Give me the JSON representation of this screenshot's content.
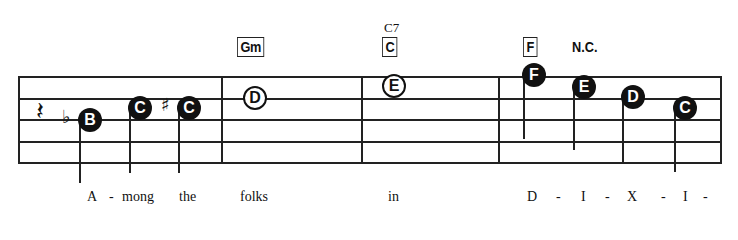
{
  "staff": {
    "lines_y": [
      76,
      98,
      119,
      141,
      162
    ],
    "left": 18,
    "right": 720,
    "barlines_x": [
      18,
      221,
      361,
      498,
      720
    ]
  },
  "rest": {
    "glyph": "𝄽",
    "name": "quarter-rest",
    "x": 36,
    "y": 96
  },
  "chords": [
    {
      "label": "Gm",
      "boxed": true,
      "x": 237,
      "y": 37
    },
    {
      "label": "C",
      "boxed": true,
      "superscript": "C7",
      "x": 382,
      "y": 37
    },
    {
      "label": "F",
      "boxed": true,
      "x": 523,
      "y": 37
    },
    {
      "label": "N.C.",
      "boxed": false,
      "x": 572,
      "y": 38
    }
  ],
  "notes": [
    {
      "letter": "B",
      "style": "filled",
      "accidental": "♭",
      "x": 78,
      "y": 108,
      "stem_top": 118,
      "stem_bottom": 183
    },
    {
      "letter": "C",
      "style": "filled",
      "x": 128,
      "y": 96,
      "stem_top": 108,
      "stem_bottom": 173
    },
    {
      "letter": "C",
      "style": "filled",
      "accidental": "♯",
      "x": 177,
      "y": 96,
      "stem_top": 108,
      "stem_bottom": 173
    },
    {
      "letter": "D",
      "style": "open",
      "x": 243,
      "y": 86
    },
    {
      "letter": "E",
      "style": "open",
      "x": 382,
      "y": 74
    },
    {
      "letter": "F",
      "style": "filled",
      "x": 522,
      "y": 63,
      "stem_top": 75,
      "stem_bottom": 139
    },
    {
      "letter": "E",
      "style": "filled",
      "x": 572,
      "y": 75,
      "stem_top": 87,
      "stem_bottom": 150
    },
    {
      "letter": "D",
      "style": "filled",
      "x": 621,
      "y": 85,
      "stem_top": 97,
      "stem_bottom": 162
    },
    {
      "letter": "C",
      "style": "filled",
      "x": 673,
      "y": 96,
      "stem_top": 108,
      "stem_bottom": 172
    }
  ],
  "lyrics": [
    {
      "text": "A",
      "x": 87
    },
    {
      "text": "-",
      "x": 109
    },
    {
      "text": "mong",
      "x": 122
    },
    {
      "text": "the",
      "x": 179
    },
    {
      "text": "folks",
      "x": 240
    },
    {
      "text": "in",
      "x": 388
    },
    {
      "text": "D",
      "x": 527
    },
    {
      "text": "-",
      "x": 556
    },
    {
      "text": "I",
      "x": 581
    },
    {
      "text": "-",
      "x": 605
    },
    {
      "text": "X",
      "x": 627
    },
    {
      "text": "-",
      "x": 661
    },
    {
      "text": "I",
      "x": 683
    },
    {
      "text": "-",
      "x": 703
    }
  ],
  "lyrics_y": 189
}
